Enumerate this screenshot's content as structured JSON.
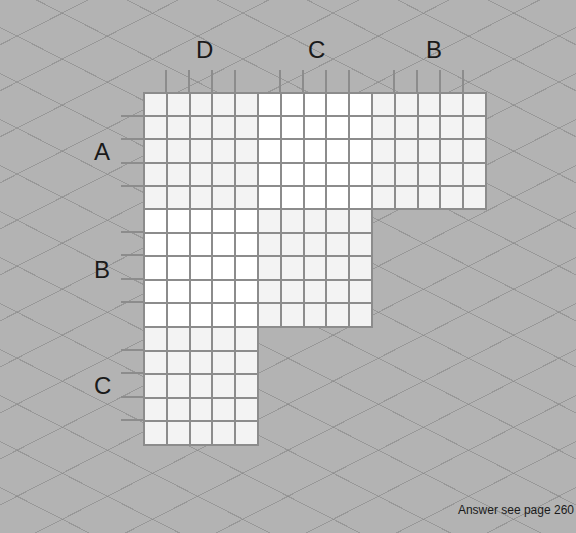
{
  "puzzle": {
    "column_groups": [
      {
        "label": "D",
        "fill": "#f3f3f3"
      },
      {
        "label": "C",
        "fill": "#ffffff"
      },
      {
        "label": "B",
        "fill": "#f3f3f3"
      }
    ],
    "row_groups": [
      {
        "label": "A"
      },
      {
        "label": "B"
      },
      {
        "label": "C"
      }
    ],
    "blocks": [
      {
        "row": "A",
        "col": "D",
        "fill": "#f3f3f3"
      },
      {
        "row": "A",
        "col": "C",
        "fill": "#ffffff"
      },
      {
        "row": "A",
        "col": "B",
        "fill": "#f3f3f3"
      },
      {
        "row": "B",
        "col": "D",
        "fill": "#ffffff"
      },
      {
        "row": "B",
        "col": "C",
        "fill": "#f3f3f3"
      },
      {
        "row": "C",
        "col": "D",
        "fill": "#f3f3f3"
      }
    ],
    "cells_per_block": 25,
    "grid_line_color": "#8c8c8c"
  },
  "footer": {
    "answer_text": "Answer see page 260"
  }
}
